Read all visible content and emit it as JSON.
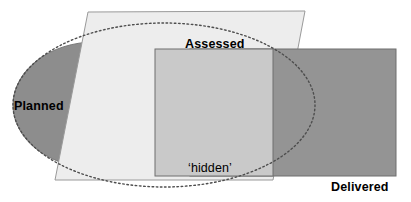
{
  "diagram": {
    "canvas": {
      "width": 411,
      "height": 202,
      "background": "#ffffff"
    },
    "palette": {
      "planned_fill": "#8d8d8d",
      "planned_stroke": "#6f6f6f",
      "assessed_fill": "#ededed",
      "assessed_stroke": "#9a9a9a",
      "delivered_fill": "#949494",
      "delivered_stroke": "#6f6f6f",
      "hidden_fill": "#c9c9c9",
      "hidden_stroke": "#6f6f6f",
      "dotted_outline": "#555555",
      "label_color": "#000000"
    },
    "shapes": [
      {
        "key": "planned",
        "name": "Planned",
        "type": "ellipse",
        "label": "Planned",
        "label_weight": "bold",
        "fill": "#8d8d8d",
        "geometry": {
          "cx": 95,
          "cy": 105,
          "rx": 82,
          "ry": 63
        },
        "label_position": {
          "x": 14,
          "y": 110
        }
      },
      {
        "key": "assessed",
        "name": "Assessed",
        "type": "parallelogram",
        "label": "Assessed",
        "label_weight": "bold",
        "fill": "#ededed",
        "geometry": {
          "points": "88,12 305,11 273,180 55,180"
        },
        "label_position": {
          "x": 185,
          "y": 48
        }
      },
      {
        "key": "delivered",
        "name": "Delivered",
        "type": "rectangle",
        "label": "Delivered",
        "label_weight": "bold",
        "fill": "#949494",
        "geometry": {
          "x": 190,
          "y": 49,
          "width": 206,
          "height": 127
        },
        "label_position": {
          "x": 331,
          "y": 191
        }
      },
      {
        "key": "hidden",
        "name": "hidden overlap region",
        "type": "rectangle",
        "label": "‘hidden’",
        "label_weight": "normal",
        "fill": "#c9c9c9",
        "geometry": {
          "x": 155,
          "y": 49,
          "width": 118,
          "height": 127
        },
        "label_position": {
          "x": 188,
          "y": 172
        }
      },
      {
        "key": "planned-outline",
        "name": "Planned hidden outline",
        "type": "dotted-ellipse",
        "label": "",
        "fill": "none",
        "geometry": {
          "cx": 164,
          "cy": 105,
          "rx": 151,
          "ry": 82
        }
      }
    ],
    "labels": {
      "planned": "Planned",
      "assessed": "Assessed",
      "delivered": "Delivered",
      "hidden": "‘hidden’"
    }
  }
}
